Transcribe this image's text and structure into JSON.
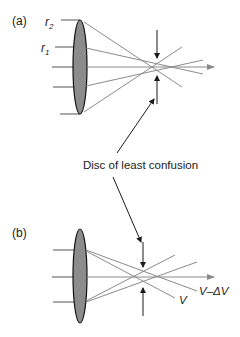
{
  "panel_a": {
    "label": "(a)",
    "r2_label": "r",
    "r2_sub": "2",
    "r1_label": "r",
    "r1_sub": "1"
  },
  "panel_b": {
    "label": "(b)",
    "v_label": "V",
    "v_minus_dv_label": "V–ΔV"
  },
  "annotation": {
    "disc_label": "Disc of least confusion"
  },
  "colors": {
    "lens_fill": "#8c8c8c",
    "ray": "#8a8a8a",
    "ink": "#1a1a1a"
  }
}
